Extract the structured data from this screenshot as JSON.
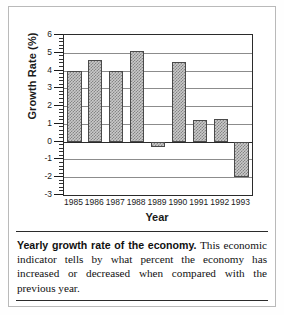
{
  "figure": {
    "caption_lead": "Yearly growth rate of the economy.",
    "caption_body": " This economic indicator tells by what percent the economy has increased or decreased when compared with the previous year."
  },
  "chart_data": {
    "type": "bar",
    "title": "",
    "xlabel": "Year",
    "ylabel": "Growth Rate (%)",
    "categories": [
      "1985",
      "1986",
      "1987",
      "1988",
      "1989",
      "1990",
      "1991",
      "1992",
      "1993"
    ],
    "values": [
      4.0,
      4.6,
      4.0,
      5.1,
      -0.3,
      4.5,
      1.2,
      1.3,
      -2.0
    ],
    "ylim": [
      -3,
      6
    ],
    "ytick_labels": [
      "6",
      "5",
      "4",
      "3",
      "2",
      "1",
      "0",
      "-1",
      "-2",
      "-3"
    ],
    "ytick_values": [
      6,
      5,
      4,
      3,
      2,
      1,
      0,
      -1,
      -2,
      -3
    ],
    "ytick_minor_step": 0.2,
    "grid": true,
    "grid_axis": "y",
    "legend": "none",
    "bar_fill": "#c9c9c9",
    "bar_edge": "#4a4a4a",
    "grid_color": "#8c8c8c",
    "axis_color": "#2b2b2b"
  }
}
